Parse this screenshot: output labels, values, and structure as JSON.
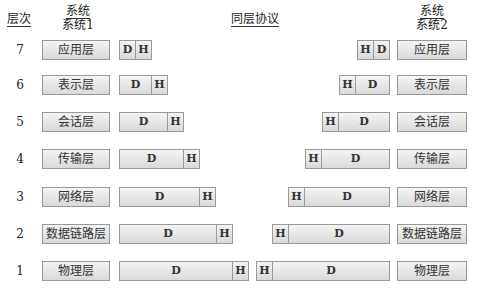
{
  "headers": {
    "level": "层次",
    "system1_top": "系统",
    "system1_bottom": "系统1",
    "protocol": "同层协议",
    "system2_top": "系统",
    "system2_bottom": "系统2"
  },
  "segment_labels": {
    "data": "D",
    "header": "H"
  },
  "rows": [
    {
      "level": "7",
      "layer": "应用层",
      "y": 40,
      "left_pkt": {
        "x": 119,
        "w": 33
      },
      "right_pkt": {
        "x": 357,
        "w": 33
      }
    },
    {
      "level": "6",
      "layer": "表示层",
      "y": 75,
      "left_pkt": {
        "x": 119,
        "w": 49
      },
      "right_pkt": {
        "x": 339,
        "w": 51
      }
    },
    {
      "level": "5",
      "layer": "会话层",
      "y": 112,
      "left_pkt": {
        "x": 119,
        "w": 65
      },
      "right_pkt": {
        "x": 322,
        "w": 68
      }
    },
    {
      "level": "4",
      "layer": "传输层",
      "y": 149,
      "left_pkt": {
        "x": 119,
        "w": 81
      },
      "right_pkt": {
        "x": 305,
        "w": 85
      }
    },
    {
      "level": "3",
      "layer": "网络层",
      "y": 187,
      "left_pkt": {
        "x": 119,
        "w": 97
      },
      "right_pkt": {
        "x": 288,
        "w": 102
      }
    },
    {
      "level": "2",
      "layer": "数据链路层",
      "y": 224,
      "left_pkt": {
        "x": 119,
        "w": 114
      },
      "right_pkt": {
        "x": 272,
        "w": 118
      }
    },
    {
      "level": "1",
      "layer": "物理层",
      "y": 261,
      "left_pkt": {
        "x": 119,
        "w": 130
      },
      "right_pkt": {
        "x": 256,
        "w": 134
      }
    }
  ]
}
